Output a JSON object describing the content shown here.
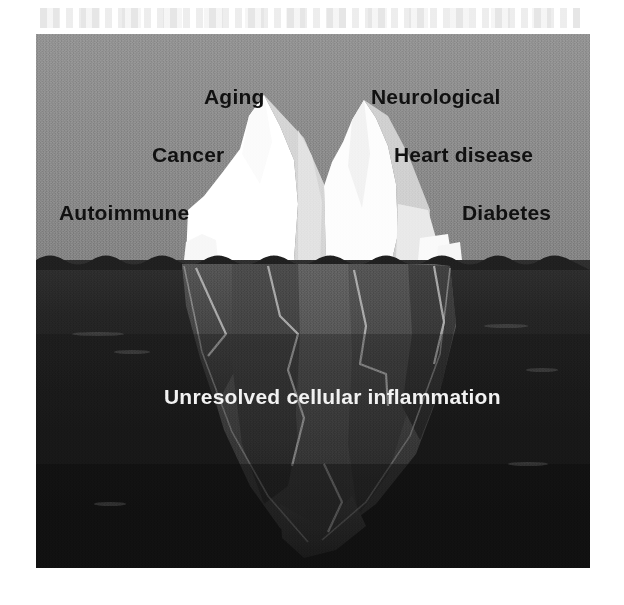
{
  "figure": {
    "type": "iceberg-diagram",
    "above_water_labels": [
      {
        "id": "aging",
        "text": "Aging"
      },
      {
        "id": "neurological",
        "text": "Neurological"
      },
      {
        "id": "cancer",
        "text": "Cancer"
      },
      {
        "id": "heart-disease",
        "text": "Heart disease"
      },
      {
        "id": "autoimmune",
        "text": "Autoimmune"
      },
      {
        "id": "diabetes",
        "text": "Diabetes"
      }
    ],
    "below_water_label": {
      "id": "inflammation",
      "text": "Unresolved cellular inflammation"
    },
    "colors": {
      "sky": "#8b8b8b",
      "deep_water": "#1d1d1d",
      "water_upper": "#2a2a2a",
      "ice_bright": "#ffffff",
      "ice_light": "#f3f3f3",
      "ice_mid": "#d8d8d8",
      "ice_shade": "#c2c2c2",
      "submerged_light": "#5a5a5a",
      "submerged_mid": "#464646",
      "submerged_dark": "#363636",
      "label_sky_text": "#101010",
      "label_water_text": "#f2f2f2",
      "page_background": "#ffffff"
    }
  }
}
